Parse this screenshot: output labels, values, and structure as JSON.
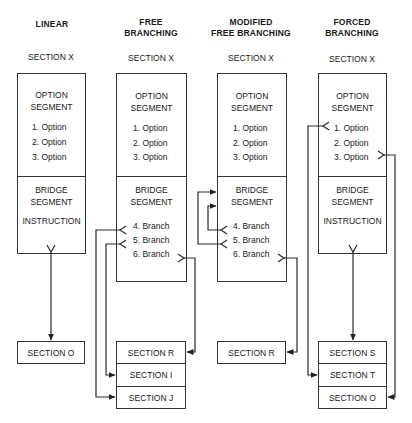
{
  "columns": [
    {
      "heading": [
        "",
        "LINEAR"
      ],
      "section_title": "SECTION X",
      "option_segment": {
        "label": [
          "OPTION",
          "SEGMENT"
        ],
        "options": [
          "1.  Option",
          "2.  Option",
          "3.  Option"
        ]
      },
      "bridge_segment": {
        "label": [
          "BRIDGE",
          "SEGMENT"
        ],
        "instruction": "INSTRUCTION",
        "branches": []
      },
      "targets": [
        "SECTION O"
      ]
    },
    {
      "heading": [
        "FREE",
        "BRANCHING"
      ],
      "section_title": "SECTION X",
      "option_segment": {
        "label": [
          "OPTION",
          "SEGMENT"
        ],
        "options": [
          "1.  Option",
          "2.  Option",
          "3.  Option"
        ]
      },
      "bridge_segment": {
        "label": [
          "BRIDGE",
          "SEGMENT"
        ],
        "branches": [
          "4.  Branch",
          "5.  Branch",
          "6.  Branch"
        ]
      },
      "targets": [
        "SECTION R",
        "SECTION I",
        "SECTION J"
      ]
    },
    {
      "heading": [
        "MODIFIED",
        "FREE BRANCHING"
      ],
      "section_title": "SECTION X",
      "option_segment": {
        "label": [
          "OPTION",
          "SEGMENT"
        ],
        "options": [
          "1.  Option",
          "2.  Option",
          "3.  Option"
        ]
      },
      "bridge_segment": {
        "label": [
          "BRIDGE",
          "SEGMENT"
        ],
        "branches": [
          "4.  Branch",
          "5.  Branch",
          "6.  Branch"
        ]
      },
      "targets": [
        "SECTION R"
      ]
    },
    {
      "heading": [
        "FORCED",
        "BRANCHING"
      ],
      "section_title": "SECTION X",
      "option_segment": {
        "label": [
          "OPTION",
          "SEGMENT"
        ],
        "options": [
          "1.  Option",
          "2.  Option",
          "3.  Option"
        ]
      },
      "bridge_segment": {
        "label": [
          "BRIDGE",
          "SEGMENT"
        ],
        "instruction": "INSTRUCTION",
        "branches": []
      },
      "targets": [
        "SECTION S",
        "SECTION T",
        "SECTION O"
      ]
    }
  ],
  "colors": {
    "line": "#333333",
    "background": "#ffffff",
    "text": "#1a1a1a"
  }
}
